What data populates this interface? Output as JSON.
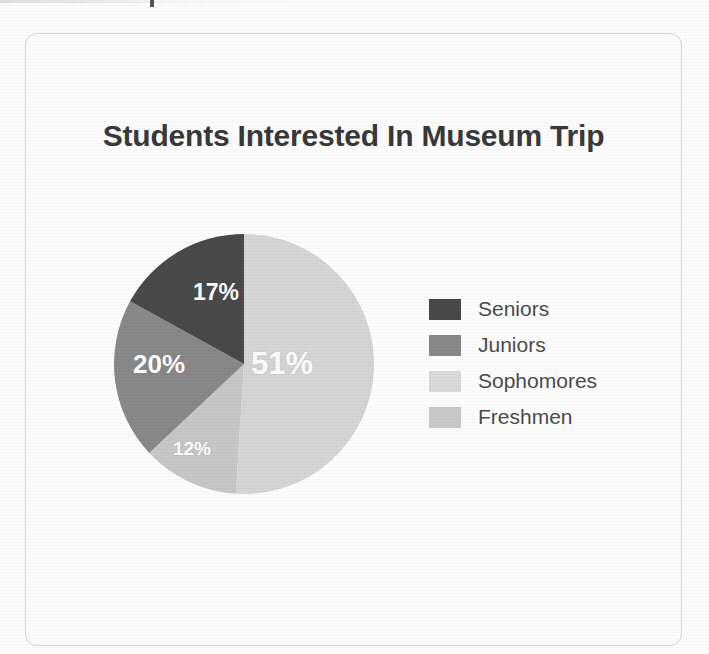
{
  "card": {
    "border_color": "#d9d9d9"
  },
  "chart_data": {
    "type": "pie",
    "title": "Students Interested In Museum Trip",
    "xlabel": "",
    "ylabel": "",
    "grid": false,
    "legend_position": "right",
    "start_angle_deg": 0,
    "direction": "clockwise",
    "unit": "%",
    "categories": [
      "Sophomores",
      "Freshmen",
      "Juniors",
      "Seniors"
    ],
    "values": [
      51,
      12,
      20,
      17
    ],
    "data_labels": [
      "51%",
      "12%",
      "20%",
      "17%"
    ],
    "colors": [
      "#d7d7d7",
      "#c9c9c9",
      "#8a8a8a",
      "#4a4a4a"
    ],
    "slices": [
      {
        "label": "Sophomores",
        "value": 51,
        "data_label": "51%",
        "color": "#d7d7d7"
      },
      {
        "label": "Freshmen",
        "value": 12,
        "data_label": "12%",
        "color": "#c9c9c9"
      },
      {
        "label": "Juniors",
        "value": 20,
        "data_label": "20%",
        "color": "#8a8a8a"
      },
      {
        "label": "Seniors",
        "value": 17,
        "data_label": "17%",
        "color": "#4a4a4a"
      }
    ],
    "legend_entries": [
      {
        "label": "Seniors",
        "color": "#4a4a4a"
      },
      {
        "label": "Juniors",
        "color": "#8a8a8a"
      },
      {
        "label": "Sophomores",
        "color": "#dcdcdc"
      },
      {
        "label": "Freshmen",
        "color": "#cbcbcb"
      }
    ]
  }
}
